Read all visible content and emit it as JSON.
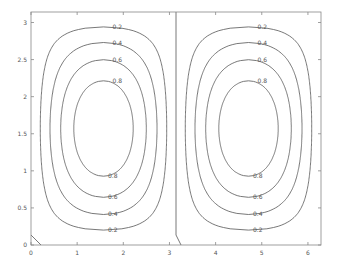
{
  "chart_data": {
    "type": "contour",
    "title": "",
    "xlabel": "",
    "ylabel": "",
    "xlim": [
      0,
      6.2832
    ],
    "ylim": [
      0,
      3.1416
    ],
    "xticks": [
      0,
      1,
      2,
      3,
      4,
      5,
      6
    ],
    "xtick_labels": [
      "0",
      "1",
      "2",
      "3",
      "4",
      "5",
      "6"
    ],
    "yticks": [
      0,
      0.5,
      1,
      1.5,
      2,
      2.5,
      3
    ],
    "ytick_labels": [
      "0",
      "0.5",
      "1",
      "1.5",
      "2",
      "2.5",
      "3"
    ],
    "grid": false,
    "legend": null,
    "field": "abs(sin(x) * sin(y))",
    "levels": [
      0,
      0.2,
      0.4,
      0.6,
      0.8
    ],
    "level_labels": [
      "0",
      "0.2",
      "0.4",
      "0.6",
      "0.8"
    ],
    "cells": [
      {
        "name": "left-cell",
        "x_range": [
          0,
          3.1416
        ],
        "center": [
          1.5708,
          1.5708
        ]
      },
      {
        "name": "right-cell",
        "x_range": [
          3.1416,
          6.2832
        ],
        "center": [
          4.7124,
          1.5708
        ]
      }
    ],
    "zero_contour_x": 3.1416,
    "colors": {
      "line": "#555555",
      "axis": "#888888",
      "text": "#555555",
      "background": "#ffffff"
    }
  },
  "plot_area": {
    "left": 31,
    "right": 321,
    "top": 12,
    "bottom": 245
  }
}
